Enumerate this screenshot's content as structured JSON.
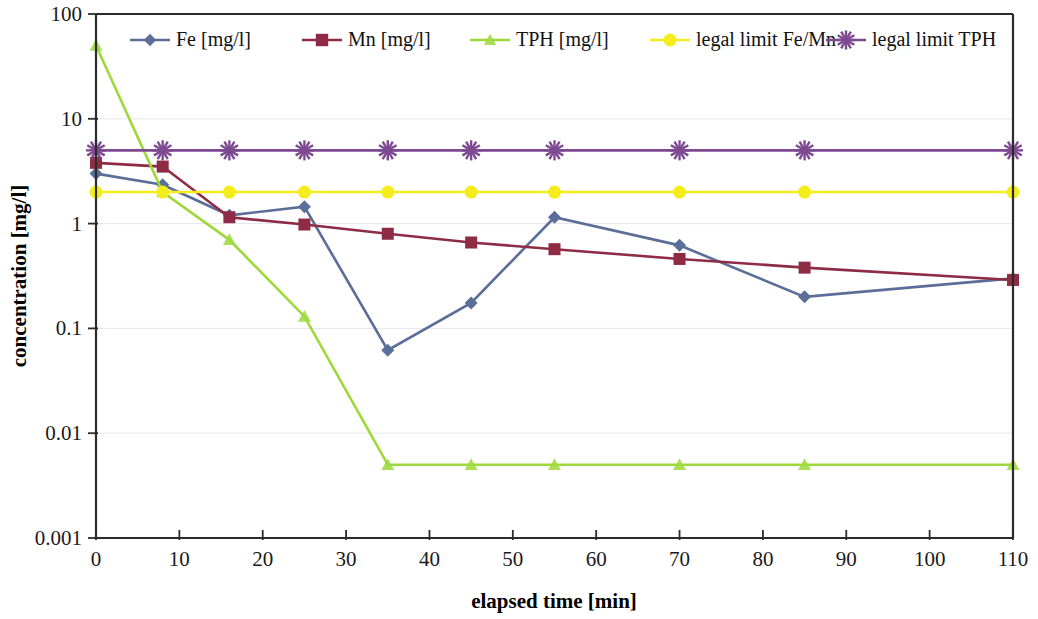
{
  "chart_data": {
    "type": "line",
    "title": "",
    "xlabel": "elapsed time [min]",
    "ylabel": "concentration [mg/l]",
    "yscale": "log",
    "ylim": [
      0.001,
      100
    ],
    "xlim": [
      0,
      110
    ],
    "ytick_labels": [
      "100",
      "10",
      "1",
      "0.1",
      "0.01",
      "0.001"
    ],
    "ytick_values": [
      100,
      10,
      1,
      0.1,
      0.01,
      0.001
    ],
    "xtick_labels": [
      "0",
      "10",
      "20",
      "30",
      "40",
      "50",
      "60",
      "70",
      "80",
      "90",
      "100",
      "110"
    ],
    "xtick_values": [
      0,
      10,
      20,
      30,
      40,
      50,
      60,
      70,
      80,
      90,
      100,
      110
    ],
    "grid": true,
    "legend_position": "top-inside",
    "x": [
      0,
      8,
      16,
      25,
      35,
      45,
      55,
      70,
      85,
      110
    ],
    "series": [
      {
        "name": "Fe [mg/l]",
        "color": "#5a6e99",
        "marker": "diamond",
        "values": [
          3.0,
          2.35,
          1.2,
          1.45,
          0.062,
          0.175,
          1.15,
          0.62,
          0.2,
          0.3
        ]
      },
      {
        "name": "Mn [mg/l]",
        "color": "#8e2c46",
        "marker": "square",
        "values": [
          3.8,
          3.5,
          1.15,
          0.98,
          0.8,
          0.66,
          0.57,
          0.46,
          0.38,
          0.29
        ]
      },
      {
        "name": "TPH [mg/l]",
        "color": "#9ed93c",
        "marker": "triangle",
        "values": [
          50.0,
          2.0,
          0.7,
          0.13,
          0.005,
          0.005,
          0.005,
          0.005,
          0.005,
          0.005
        ]
      },
      {
        "name": "legal limit Fe/Mn",
        "color": "#f5ec1c",
        "marker": "circle",
        "values": [
          2.0,
          2.0,
          2.0,
          2.0,
          2.0,
          2.0,
          2.0,
          2.0,
          2.0,
          2.0
        ]
      },
      {
        "name": "legal limit  TPH",
        "color": "#7d4a92",
        "marker": "star",
        "values": [
          5.0,
          5.0,
          5.0,
          5.0,
          5.0,
          5.0,
          5.0,
          5.0,
          5.0,
          5.0
        ]
      }
    ]
  },
  "legend": {
    "items": [
      {
        "label": "Fe [mg/l]"
      },
      {
        "label": "Mn [mg/l]"
      },
      {
        "label": "TPH [mg/l]"
      },
      {
        "label": "legal limit Fe/Mn"
      },
      {
        "label": "legal limit  TPH"
      }
    ]
  },
  "axes": {
    "x_title": "elapsed time [min]",
    "y_title": "concentration [mg/l]"
  },
  "colors": {
    "fe": "#5a6e99",
    "mn": "#8e2c46",
    "tph": "#9ed93c",
    "limit_fe_mn": "#f5ec1c",
    "limit_tph": "#7d4a92",
    "axis": "#2b2b2b",
    "grid": "#e8e4ef",
    "background": "#ffffff"
  }
}
